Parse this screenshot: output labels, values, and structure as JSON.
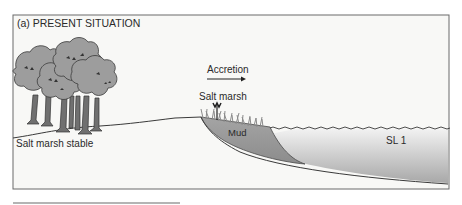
{
  "panel": {
    "title": "(a) PRESENT SITUATION"
  },
  "labels": {
    "accretion": "Accretion",
    "salt_marsh": "Salt marsh",
    "mud": "Mud",
    "salt_marsh_stable": "Salt marsh stable",
    "sea_level": "SL 1"
  },
  "colors": {
    "frame": "#6a6a6a",
    "background": "#f7f7f5",
    "tree_canopy": "#9a9a9a",
    "tree_trunk": "#6e6e6e",
    "mud": "#9c9c9c",
    "water_top": "#f2f2f2",
    "water_bottom": "#a9a9a9"
  }
}
